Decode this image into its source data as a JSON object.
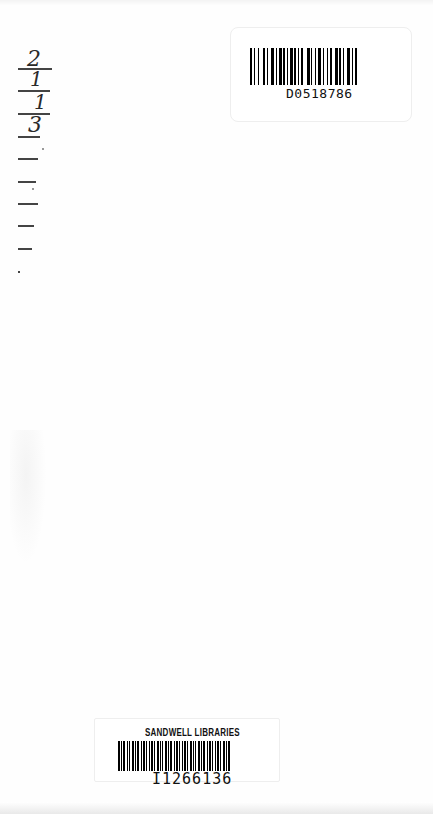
{
  "document": {
    "type": "library-book-endpaper"
  },
  "date_due_strip": {
    "entries": [
      "2",
      "1",
      "1",
      "3",
      "",
      "",
      "",
      "",
      "",
      ""
    ]
  },
  "top_label": {
    "barcode_number": "D0518786"
  },
  "bottom_label": {
    "library_name": "SANDWELL LIBRARIES",
    "barcode_number": "I1266136"
  }
}
